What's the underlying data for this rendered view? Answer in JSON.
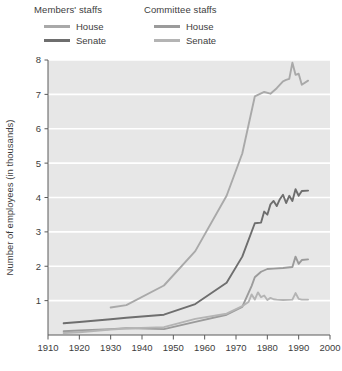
{
  "legend": {
    "groups": [
      {
        "name": "members-staffs",
        "title": "Members' staffs",
        "entries": [
          {
            "label": "House",
            "color": "#a9a9a9"
          },
          {
            "label": "Senate",
            "color": "#6e6e6e"
          }
        ]
      },
      {
        "name": "committee-staffs",
        "title": "Committee staffs",
        "entries": [
          {
            "label": "House",
            "color": "#9b9b9b"
          },
          {
            "label": "Senate",
            "color": "#b4b4b4"
          }
        ]
      }
    ]
  },
  "chart_data": {
    "type": "line",
    "title": "",
    "xlabel": "",
    "ylabel": "Number of employees (in thousands)",
    "xlim": [
      1910,
      2000
    ],
    "ylim": [
      0,
      8
    ],
    "xticks": [
      1910,
      1920,
      1930,
      1940,
      1950,
      1960,
      1970,
      1980,
      1990,
      2000
    ],
    "yticks": [
      1,
      2,
      3,
      4,
      5,
      6,
      7,
      8
    ],
    "grid": "horizontal",
    "legend_position": "above-plot",
    "plot_background": "#e7e7e7",
    "gridline_color": "#ffffff",
    "series": [
      {
        "name": "Members' staffs — House",
        "color": "#a9a9a9",
        "width": 1.9,
        "x": [
          1930,
          1935,
          1947,
          1957,
          1967,
          1972,
          1976,
          1979,
          1981,
          1983,
          1985,
          1986,
          1987,
          1988,
          1989,
          1990,
          1991,
          1993
        ],
        "y": [
          0.8,
          0.87,
          1.44,
          2.44,
          4.05,
          5.28,
          6.94,
          7.07,
          7.02,
          7.18,
          7.38,
          7.42,
          7.45,
          7.92,
          7.57,
          7.6,
          7.28,
          7.4
        ]
      },
      {
        "name": "Members' staffs — Senate",
        "color": "#6e6e6e",
        "width": 1.9,
        "x": [
          1915,
          1920,
          1930,
          1935,
          1947,
          1957,
          1967,
          1972,
          1976,
          1978,
          1979,
          1980,
          1981,
          1982,
          1983,
          1984,
          1985,
          1986,
          1987,
          1988,
          1989,
          1990,
          1991,
          1993
        ],
        "y": [
          0.34,
          0.38,
          0.46,
          0.5,
          0.59,
          0.9,
          1.52,
          2.28,
          3.25,
          3.27,
          3.59,
          3.5,
          3.8,
          3.9,
          3.75,
          3.95,
          4.08,
          3.84,
          4.05,
          3.9,
          4.24,
          4.05,
          4.19,
          4.2
        ]
      },
      {
        "name": "Committee staffs — House",
        "color": "#9b9b9b",
        "width": 1.9,
        "x": [
          1915,
          1920,
          1930,
          1935,
          1947,
          1957,
          1967,
          1972,
          1975,
          1976,
          1978,
          1980,
          1982,
          1985,
          1988,
          1989,
          1990,
          1991,
          1993
        ],
        "y": [
          0.11,
          0.13,
          0.17,
          0.2,
          0.17,
          0.38,
          0.59,
          0.82,
          1.43,
          1.68,
          1.84,
          1.92,
          1.93,
          1.95,
          1.98,
          2.28,
          2.07,
          2.18,
          2.2
        ]
      },
      {
        "name": "Committee staffs — Senate",
        "color": "#b4b4b4",
        "width": 1.9,
        "x": [
          1915,
          1920,
          1930,
          1935,
          1947,
          1957,
          1967,
          1972,
          1974,
          1975,
          1976,
          1977,
          1978,
          1979,
          1980,
          1981,
          1982,
          1983,
          1985,
          1988,
          1989,
          1990,
          1991,
          1993
        ],
        "y": [
          0.06,
          0.08,
          0.16,
          0.19,
          0.23,
          0.47,
          0.62,
          0.84,
          0.96,
          1.18,
          1.03,
          1.24,
          1.1,
          1.15,
          1.02,
          1.08,
          1.04,
          1.03,
          1.02,
          1.03,
          1.22,
          1.05,
          1.03,
          1.03
        ]
      }
    ]
  }
}
